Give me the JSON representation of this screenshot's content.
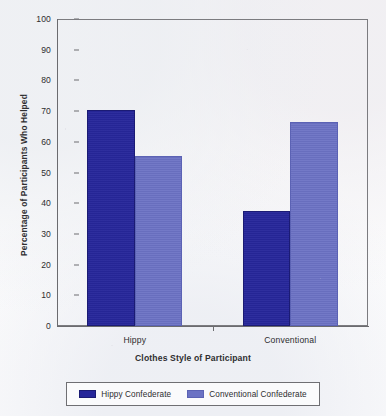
{
  "chart_data": {
    "type": "bar",
    "title": "",
    "xlabel": "Clothes Style of Participant",
    "ylabel": "Percentage of Participants Who Helped",
    "categories": [
      "Hippy",
      "Conventional"
    ],
    "series": [
      {
        "name": "Hippy Confederate",
        "values": [
          70.3,
          37.4
        ],
        "color": "#26269A"
      },
      {
        "name": "Conventional Confederate",
        "values": [
          55.3,
          66.6
        ],
        "color": "#6B72C4"
      }
    ],
    "ylim": [
      0,
      100
    ],
    "yticks": [
      0,
      10,
      20,
      30,
      40,
      50,
      60,
      70,
      80,
      90,
      100
    ],
    "ytick_labels": [
      "0",
      "10",
      "20",
      "30",
      "40",
      "50",
      "60",
      "70",
      "80",
      "90",
      "100"
    ],
    "grid": false,
    "legend_position": "bottom"
  },
  "axes": {
    "y_title": "Percentage of Participants Who Helped",
    "x_title": "Clothes Style of Participant"
  },
  "legend": {
    "entries": [
      {
        "label": "Hippy Confederate",
        "swatch": "dark-blue-swatch"
      },
      {
        "label": "Conventional Confederate",
        "swatch": "light-blue-swatch"
      }
    ]
  }
}
